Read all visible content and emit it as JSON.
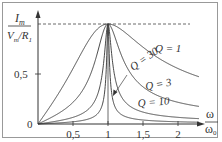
{
  "chart_data": {
    "type": "line",
    "title": "",
    "ylabel": "I_m / (V_m/R_1)",
    "ylabel_parts": {
      "num": "I",
      "num_sub": "m",
      "den_a": "V",
      "den_a_sub": "m",
      "den_b": "R",
      "den_b_sub": "1"
    },
    "xlabel": "ω / ω0",
    "xlabel_parts": {
      "num": "ω",
      "den": "ω",
      "den_sub": "0"
    },
    "xlim": [
      0,
      2.3
    ],
    "ylim": [
      0,
      1.05
    ],
    "x_ticks": [
      "0,5",
      "1",
      "1,5",
      "2"
    ],
    "x_tick_values": [
      0.5,
      1,
      1.5,
      2
    ],
    "y_ticks": [
      "0,5"
    ],
    "y_tick_values": [
      0.5
    ],
    "origin_label": "0",
    "reference_line": {
      "y": 1.0,
      "style": "dashed"
    },
    "formula": "1/sqrt(1 + Q^2 (x - 1/x)^2)",
    "series": [
      {
        "name": "Q = 1",
        "Q": 1
      },
      {
        "name": "Q = 3",
        "Q": 3
      },
      {
        "name": "Q = 10",
        "Q": 10
      },
      {
        "name": "Q = 30",
        "Q": 30
      }
    ],
    "annotations": [
      {
        "text": "Q = 1",
        "x": 1.75,
        "y": 0.9
      },
      {
        "text": "Q = 30",
        "x": 1.3,
        "y": 0.75
      },
      {
        "text": "Q = 3",
        "x": 1.75,
        "y": 0.45
      },
      {
        "text": "Q = 10",
        "x": 1.6,
        "y": 0.3
      }
    ],
    "grid": false,
    "legend": "inline labels"
  }
}
